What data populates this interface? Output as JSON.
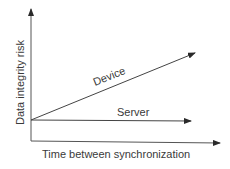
{
  "diagram": {
    "y_axis_label": "Data integrity risk",
    "x_axis_label": "Time between synchronization",
    "lines": [
      {
        "name": "device",
        "label": "Device",
        "trend": "increasing"
      },
      {
        "name": "server",
        "label": "Server",
        "trend": "flat"
      }
    ],
    "colors": {
      "stroke": "#3a3a3a",
      "background": "#ffffff"
    }
  }
}
